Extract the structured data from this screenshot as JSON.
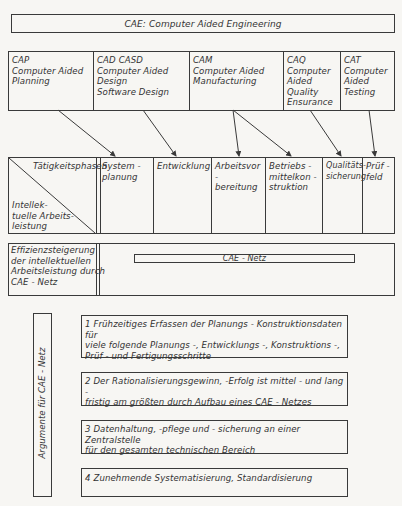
{
  "title": "CAE: Computer Aided Engineering",
  "modules": [
    {
      "id": "cap",
      "label": "CAP\nComputer Aided\nPlanning"
    },
    {
      "id": "cad",
      "label": "CAD  CASD\nComputer Aided\nDesign\nSoftware Design"
    },
    {
      "id": "cam",
      "label": "CAM\nComputer Aided\nManufacturing"
    },
    {
      "id": "caq",
      "label": "CAQ\nComputer\nAided\nQuality\nEnsurance"
    },
    {
      "id": "cat",
      "label": "CAT\nComputer\nAided\nTesting"
    }
  ],
  "phases_table": {
    "header_top": "Tätigkeitsphasen",
    "header_bottom": "Intellek-\ntuelle Arbeits-\nleistung",
    "phases": [
      "System -\nplanung",
      "Entwicklung",
      "Arbeitsvor -\nbereitung",
      "Betriebs -\nmittelkon -\nstruktion",
      "Qualitäts-\nsicherung",
      "Prüf -\nfeld"
    ]
  },
  "efficiency": {
    "label": "Effizienzsteigerung\nder intellektuellen\nArbeitsleistung durch\nCAE - Netz",
    "bar_label": "CAE - Netz"
  },
  "arguments": {
    "side_label": "Argumente  für  CAE - Netz",
    "items": [
      "1  Frühzeitiges Erfassen der Planungs - Konstruktionsdaten für\n    viele folgende Planungs -, Entwicklungs -, Konstruktions -,\n    Prüf -  und Fertigungsschritte",
      "2  Der Rationalisierungsgewinn, -Erfolg ist mittel -  und lang -\n    fristig am größten durch Aufbau eines CAE - Netzes",
      "3  Datenhaltung, -pflege und - sicherung an einer Zentralstelle\n    für den gesamten technischen Bereich",
      "4  Zunehmende  Systematisierung, Standardisierung"
    ]
  },
  "colors": {
    "line": "#3a3a3a",
    "text": "#333333",
    "background": "#f7f6f3"
  }
}
